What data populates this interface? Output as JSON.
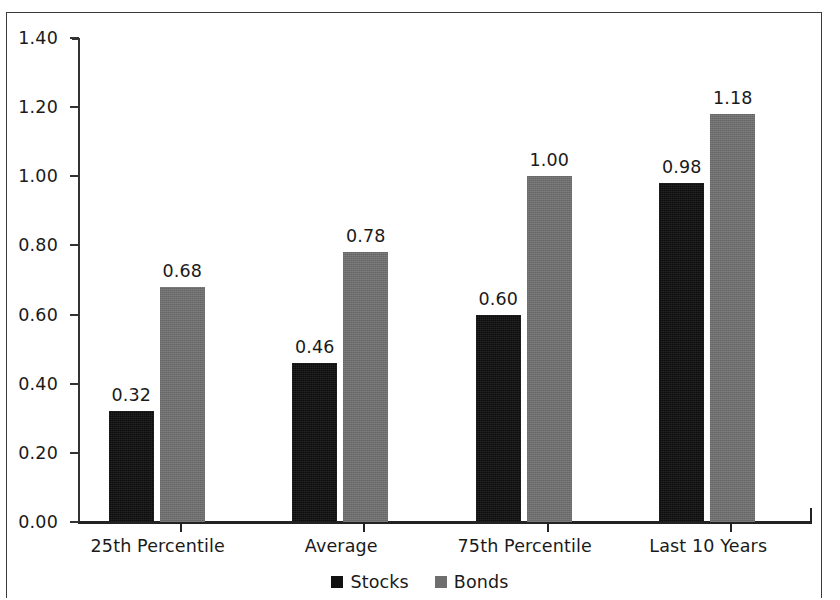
{
  "chart_data": {
    "type": "bar",
    "title": "",
    "subtitle": "",
    "xlabel": "",
    "ylabel": "",
    "ylim": [
      0.0,
      1.4
    ],
    "ytick_step": 0.2,
    "grid": false,
    "legend_position": "bottom-center",
    "categories": [
      "25th Percentile",
      "Average",
      "75th Percentile",
      "Last 10 Years"
    ],
    "ytick_labels": [
      "0.00",
      "0.20",
      "0.40",
      "0.60",
      "0.80",
      "1.00",
      "1.20",
      "1.40"
    ],
    "ytick_values": [
      0.0,
      0.2,
      0.4,
      0.6,
      0.8,
      1.0,
      1.2,
      1.4
    ],
    "series": [
      {
        "name": "Stocks",
        "color": "#0d0d0d",
        "values": [
          0.32,
          0.46,
          0.6,
          0.98
        ],
        "labels": [
          "0.32",
          "0.46",
          "0.60",
          "0.98"
        ]
      },
      {
        "name": "Bonds",
        "color": "#6e6e6e",
        "values": [
          0.68,
          0.78,
          1.0,
          1.18
        ],
        "labels": [
          "0.68",
          "0.78",
          "1.00",
          "1.18"
        ]
      }
    ]
  },
  "legend": {
    "entries": [
      {
        "label": "Stocks",
        "swatch": "stocks"
      },
      {
        "label": "Bonds",
        "swatch": "bonds"
      }
    ]
  }
}
